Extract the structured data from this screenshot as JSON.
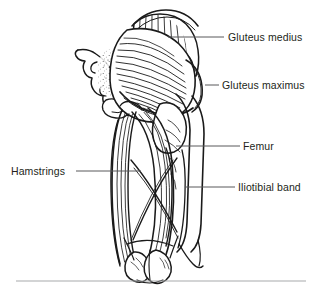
{
  "figure": {
    "line_color": "#1a1a1a",
    "fill_color": "#ffffff",
    "text_color": "#231f20",
    "leader_color": "#58595b",
    "rule_color": "#a7a9ac",
    "background": "#ffffff",
    "labels": [
      {
        "id": "gluteus-medius",
        "text": "Gluteus medius",
        "side": "right",
        "leader": {
          "x1": 168,
          "y1": 37,
          "x2": 224,
          "y2": 37
        }
      },
      {
        "id": "gluteus-maximus",
        "text": "Gluteus maximus",
        "side": "right",
        "leader": {
          "x1": 205,
          "y1": 85,
          "x2": 219,
          "y2": 85
        }
      },
      {
        "id": "femur",
        "text": "Femur",
        "side": "right",
        "leader": {
          "x1": 176,
          "y1": 146,
          "x2": 240,
          "y2": 146
        }
      },
      {
        "id": "iliotibial-band",
        "text": "Iliotibial band",
        "side": "right",
        "leader": {
          "x1": 185,
          "y1": 187,
          "x2": 235,
          "y2": 187
        }
      },
      {
        "id": "hamstrings",
        "text": "Hamstrings",
        "side": "left",
        "leader": {
          "x1": 76,
          "y1": 171,
          "x2": 141,
          "y2": 171
        }
      }
    ],
    "footer_rule": {
      "x1": 16,
      "y1": 281,
      "x2": 306,
      "y2": 281
    }
  }
}
